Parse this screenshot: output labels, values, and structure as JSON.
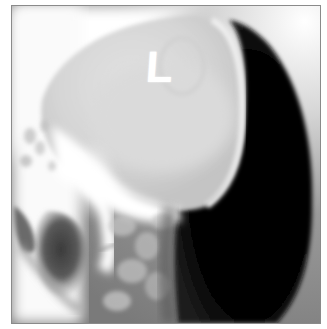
{
  "image": {
    "type": "radiograph",
    "view": "lateral skull",
    "marker_label": "L",
    "colors": {
      "frame_border": "#8a8a8a",
      "background": "#ffffff",
      "soft_tissue_dark": "#050505",
      "bone_light": "#f2f2f2"
    }
  }
}
